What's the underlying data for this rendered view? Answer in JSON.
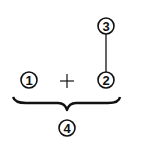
{
  "diagram": {
    "nodes": [
      {
        "id": "1",
        "label": "1",
        "cx": 29,
        "cy": 80
      },
      {
        "id": "2",
        "label": "2",
        "cx": 106,
        "cy": 80
      },
      {
        "id": "3",
        "label": "3",
        "cx": 106,
        "cy": 26
      },
      {
        "id": "4",
        "label": "4",
        "cx": 67,
        "cy": 128
      }
    ],
    "operator": {
      "symbol": "+",
      "x": 67,
      "y": 82
    },
    "connector": {
      "from": "3",
      "to": "2"
    },
    "brace": {
      "groups": [
        "1",
        "2"
      ],
      "result": "4"
    },
    "colors": {
      "stroke": "#111111",
      "background": "#ffffff"
    }
  }
}
